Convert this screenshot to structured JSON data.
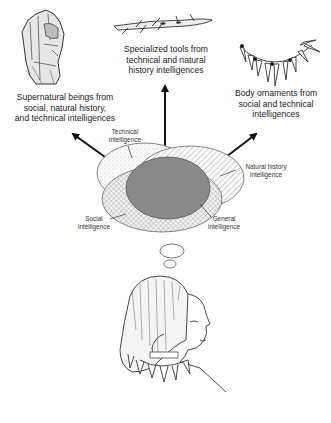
{
  "diagram": {
    "outputs": [
      {
        "id": "supernatural",
        "label": "Supernatural beings from social, natural history, and technical intelligences",
        "line1": "Supernatural beings from",
        "line2": "social, natural history,",
        "line3": "and technical intelligences",
        "icon": "figurine-icon"
      },
      {
        "id": "tools",
        "label": "Specialized tools from technical and natural history intelligences",
        "line1": "Specialized tools from",
        "line2": "technical and natural",
        "line3": "history intelligences",
        "icon": "harpoon-icon"
      },
      {
        "id": "ornaments",
        "label": "Body ornaments from social and technical intelligences",
        "line1": "Body ornaments from",
        "line2": "social and technical",
        "line3": "intelligences",
        "icon": "necklace-icon"
      }
    ],
    "intelligences": {
      "technical": {
        "line1": "Technical",
        "line2": "intelligence"
      },
      "natural_history": {
        "line1": "Natural history",
        "line2": "intelligence"
      },
      "social": {
        "line1": "Social",
        "line2": "intelligence"
      },
      "general": {
        "line1": "General",
        "line2": "intelligence"
      }
    },
    "colors": {
      "general_fill": "#8a8a8a",
      "outline": "#555555",
      "arrow": "#111111"
    }
  }
}
